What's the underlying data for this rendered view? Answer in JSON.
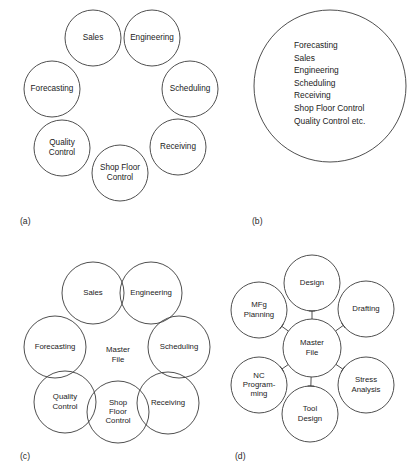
{
  "figure": {
    "panels": [
      {
        "tag": "(a)",
        "tag_pos": {
          "x": 20,
          "y": 222
        },
        "type": "ring-of-circles",
        "radius": 28,
        "circles": [
          {
            "name": "sales",
            "cx": 93,
            "cy": 38,
            "lines": [
              "Sales"
            ]
          },
          {
            "name": "engineering",
            "cx": 152,
            "cy": 38,
            "lines": [
              "Engineering"
            ]
          },
          {
            "name": "scheduling",
            "cx": 190,
            "cy": 89,
            "lines": [
              "Scheduling"
            ]
          },
          {
            "name": "receiving",
            "cx": 178,
            "cy": 147,
            "lines": [
              "Receiving"
            ]
          },
          {
            "name": "shop-floor-control",
            "cx": 120,
            "cy": 173,
            "lines": [
              "Shop Floor",
              "Control"
            ]
          },
          {
            "name": "quality-control",
            "cx": 62,
            "cy": 148,
            "lines": [
              "Quality",
              "Control"
            ]
          },
          {
            "name": "forecasting",
            "cx": 52,
            "cy": 89,
            "lines": [
              "Forecasting"
            ]
          }
        ]
      },
      {
        "tag": "(b)",
        "tag_pos": {
          "x": 252,
          "y": 222
        },
        "type": "single-large-circle",
        "circle": {
          "name": "integrated-database",
          "cx": 330,
          "cy": 86,
          "r": 76
        },
        "text_origin": {
          "x": 294,
          "y": 46
        },
        "line_height": 12.6,
        "lines": [
          "Forecasting",
          "Sales",
          "Engineering",
          "Scheduling",
          "Receiving",
          "Shop Floor Control",
          "Quality Control  etc."
        ]
      },
      {
        "tag": "(c)",
        "tag_pos": {
          "x": 20,
          "y": 457
        },
        "type": "overlapping-ring-with-center",
        "radius": 31,
        "center": {
          "name": "master-file",
          "cx": 118,
          "cy": 355,
          "lines": [
            "Master",
            "File"
          ]
        },
        "circles": [
          {
            "name": "sales",
            "cx": 93,
            "cy": 293,
            "lines": [
              "Sales"
            ]
          },
          {
            "name": "engineering",
            "cx": 151,
            "cy": 293,
            "lines": [
              "Engineering"
            ]
          },
          {
            "name": "scheduling",
            "cx": 179,
            "cy": 347,
            "lines": [
              "Scheduling"
            ]
          },
          {
            "name": "receiving",
            "cx": 168,
            "cy": 403,
            "lines": [
              "Receiving"
            ]
          },
          {
            "name": "shop-floor-control",
            "cx": 118,
            "cy": 412,
            "lines": [
              "Shop",
              "Floor",
              "Control"
            ]
          },
          {
            "name": "quality-control",
            "cx": 65,
            "cy": 402,
            "lines": [
              "Quality",
              "Control"
            ]
          },
          {
            "name": "forecasting",
            "cx": 55,
            "cy": 347,
            "lines": [
              "Forecasting"
            ]
          }
        ]
      },
      {
        "tag": "(d)",
        "tag_pos": {
          "x": 235,
          "y": 457
        },
        "type": "hub-and-spoke",
        "radius": 28,
        "center": {
          "name": "master-file",
          "cx": 312,
          "cy": 348,
          "r": 29,
          "lines": [
            "Master",
            "File"
          ]
        },
        "circles": [
          {
            "name": "design",
            "cx": 312,
            "cy": 283,
            "lines": [
              "Design"
            ]
          },
          {
            "name": "drafting",
            "cx": 366,
            "cy": 309,
            "lines": [
              "Drafting"
            ]
          },
          {
            "name": "stress-analysis",
            "cx": 366,
            "cy": 385,
            "lines": [
              "Stress",
              "Analysis"
            ]
          },
          {
            "name": "tool-design",
            "cx": 310,
            "cy": 414,
            "lines": [
              "Tool",
              "Design"
            ]
          },
          {
            "name": "nc-programming",
            "cx": 259,
            "cy": 385,
            "lines": [
              "NC",
              "Program-",
              "ming"
            ]
          },
          {
            "name": "mfg-planning",
            "cx": 259,
            "cy": 310,
            "lines": [
              "MFg",
              "Planning"
            ]
          }
        ]
      }
    ]
  },
  "colors": {
    "stroke": "#3b3b3b",
    "text": "#1b1b1b",
    "background": "#ffffff"
  }
}
